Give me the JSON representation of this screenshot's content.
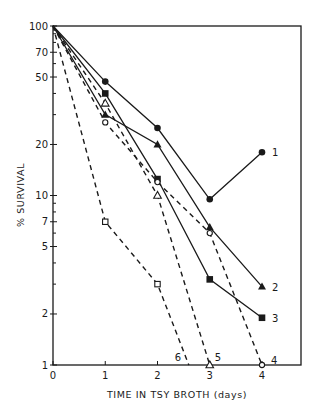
{
  "chart_data": {
    "type": "line",
    "title": "",
    "xlabel": "TIME IN TSY BROTH (days)",
    "ylabel": "% SURVIVAL",
    "xlim": [
      0,
      4.75
    ],
    "ylim": [
      1,
      100
    ],
    "yscale": "log",
    "grid": false,
    "legend": "inline numeric labels at line ends",
    "x_ticks": [
      0,
      1,
      2,
      3,
      4
    ],
    "x_tick_labels": [
      "0",
      "1",
      "2",
      "3",
      "4"
    ],
    "y_ticks": [
      1,
      2,
      5,
      7,
      10,
      20,
      50,
      70,
      100
    ],
    "y_tick_labels": [
      "1",
      "2",
      "5",
      "7",
      "10",
      "20",
      "50",
      "70",
      "100"
    ],
    "series": [
      {
        "name": "1",
        "marker": "filled-circle",
        "line": "solid",
        "x": [
          0,
          1,
          2,
          3,
          4
        ],
        "values": [
          100,
          47,
          25,
          9.5,
          18
        ]
      },
      {
        "name": "2",
        "marker": "filled-triangle",
        "line": "solid",
        "x": [
          0,
          1,
          2,
          3,
          4
        ],
        "values": [
          100,
          30,
          20,
          6.5,
          2.9
        ]
      },
      {
        "name": "3",
        "marker": "filled-square",
        "line": "solid",
        "x": [
          0,
          1,
          2,
          3,
          4
        ],
        "values": [
          100,
          40,
          12.5,
          3.2,
          1.9
        ]
      },
      {
        "name": "4",
        "marker": "open-circle",
        "line": "dashed",
        "x": [
          0,
          1,
          2,
          3,
          4
        ],
        "values": [
          100,
          27,
          12,
          6,
          1
        ]
      },
      {
        "name": "5",
        "marker": "open-triangle",
        "line": "dashed",
        "x": [
          0,
          1,
          2,
          3
        ],
        "values": [
          100,
          35,
          10,
          1
        ]
      },
      {
        "name": "6",
        "marker": "open-square",
        "line": "dashed",
        "x": [
          0,
          1,
          2,
          2.6
        ],
        "values": [
          100,
          7,
          3,
          1
        ]
      }
    ]
  }
}
